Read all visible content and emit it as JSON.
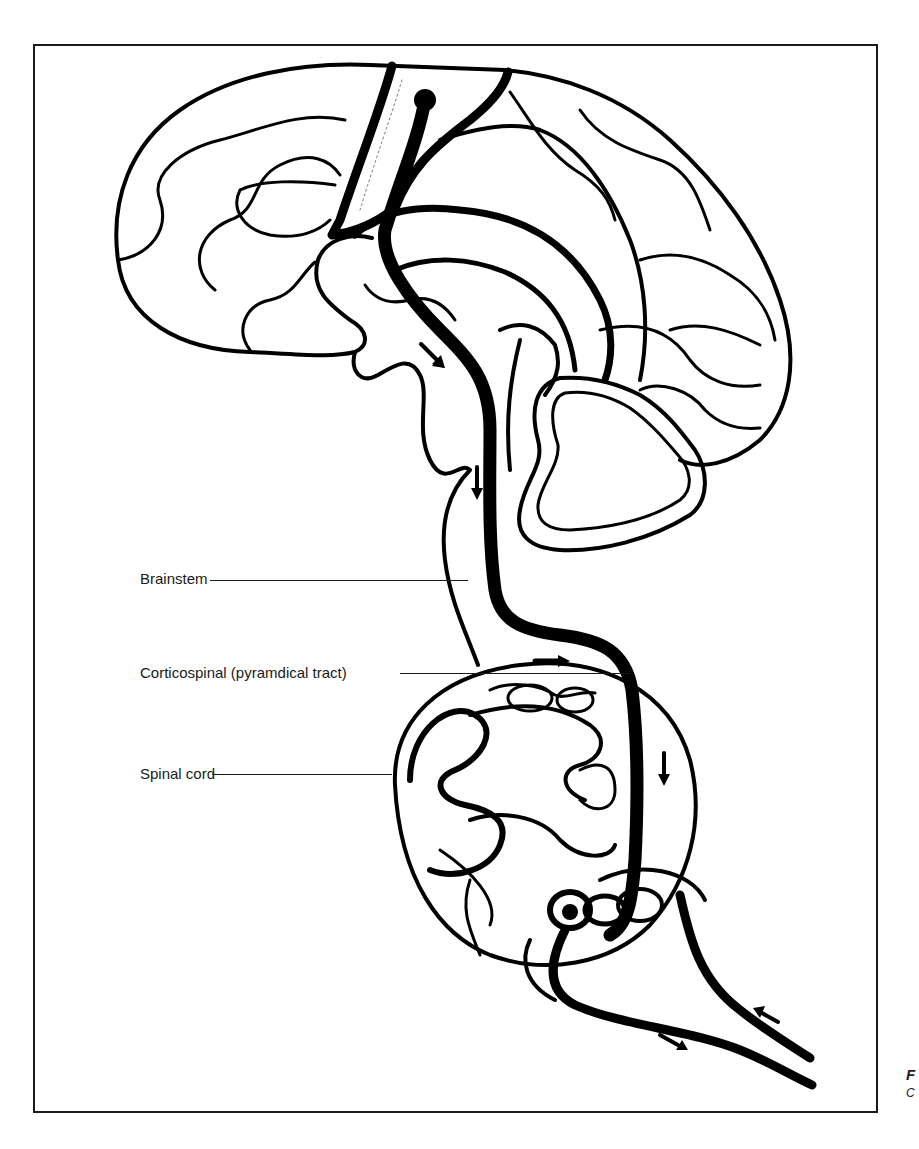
{
  "figure": {
    "frame_color": "#1a1a1a",
    "line_color": "#000000",
    "background": "#ffffff"
  },
  "labels": {
    "brainstem": "Brainstem",
    "corticospinal": "Corticospinal (pyramdical tract)",
    "spinal_cord": "Spinal cord"
  },
  "edge_fragment": {
    "line1": "F",
    "line2": "C"
  }
}
